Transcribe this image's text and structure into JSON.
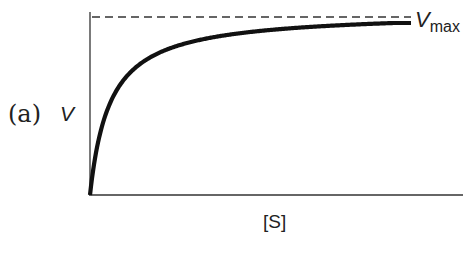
{
  "panel_label": "(a)",
  "axes": {
    "ylabel": "V",
    "xlabel": "[S]"
  },
  "asymptote_label": {
    "main": "V",
    "subscript": "max"
  },
  "colors": {
    "curve": "#111111",
    "axis": "#333333",
    "dashed": "#333333"
  },
  "chart_data": {
    "type": "line",
    "title": "",
    "panel": "(a)",
    "xlabel": "[S]",
    "ylabel": "V",
    "grid": false,
    "legend": null,
    "ticks": "none",
    "series": [
      {
        "name": "V vs [S]",
        "style": "solid thick",
        "x": [
          0,
          0.05,
          0.1,
          0.2,
          0.3,
          0.4,
          0.5,
          0.6,
          0.7,
          0.8,
          0.9,
          1.0
        ],
        "y": [
          0,
          0.7,
          0.83,
          0.91,
          0.94,
          0.95,
          0.96,
          0.97,
          0.97,
          0.975,
          0.98,
          0.98
        ]
      },
      {
        "name": "Vmax",
        "style": "dashed horizontal asymptote",
        "x": [
          0,
          1.0
        ],
        "y": [
          1.0,
          1.0
        ]
      }
    ],
    "annotations": [
      "Vmax (at the right end of the dashed line)"
    ],
    "xlim": [
      0,
      1.0
    ],
    "ylim": [
      0,
      1.05
    ]
  }
}
